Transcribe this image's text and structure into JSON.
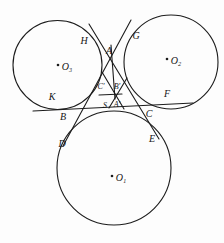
{
  "figure": {
    "type": "geometry-diagram",
    "background": "#fdfdfd",
    "stroke_color": "#1c1c1c",
    "labels": {
      "H": "H",
      "G": "G",
      "A": "A",
      "K": "K",
      "F": "F",
      "B": "B",
      "C": "C",
      "D": "D",
      "E": "E",
      "C_prime": "C′",
      "B_prime": "B′",
      "S": "S",
      "A_prime": "A′",
      "O1": "O₁",
      "O2": "O₂",
      "O3": "O₃"
    },
    "circles": [
      {
        "name": "circle-O3",
        "label": "O₃"
      },
      {
        "name": "circle-O2",
        "label": "O₂"
      },
      {
        "name": "circle-O1",
        "label": "O₁"
      }
    ],
    "lines": [
      {
        "name": "tangent-KF",
        "desc": "near-horizontal common tangent touching O3 at K, O2 at F, grazing top of O1"
      },
      {
        "name": "tangent-HE",
        "desc": "slanted common tangent from H on O3 through A and C down to E on O1"
      },
      {
        "name": "tangent-GD",
        "desc": "slanted common tangent from G on O2 through A and B down to D on O1"
      },
      {
        "name": "segment-A-S",
        "desc": "vertical segment from A down to S"
      },
      {
        "name": "segment-CprimeBprime",
        "desc": "short bar under C' and B'"
      },
      {
        "name": "segment-star-left",
        "desc": "short diagonal through central point"
      },
      {
        "name": "segment-star-right",
        "desc": "short diagonal through central point"
      }
    ]
  }
}
